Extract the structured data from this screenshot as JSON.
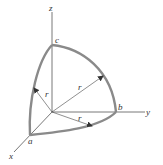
{
  "diagram": {
    "title": "",
    "axes": [
      {
        "name": "x",
        "label": "x"
      },
      {
        "name": "y",
        "label": "y"
      },
      {
        "name": "z",
        "label": "z"
      }
    ],
    "points": [
      {
        "name": "a",
        "label": "a"
      },
      {
        "name": "b",
        "label": "b"
      },
      {
        "name": "c",
        "label": "c"
      }
    ],
    "radius_label": "r",
    "radius_labels": [
      "r",
      "r",
      "r"
    ],
    "colors": {
      "axis": "#555555",
      "arc": "#8a8a8a",
      "label": "#333333"
    }
  }
}
